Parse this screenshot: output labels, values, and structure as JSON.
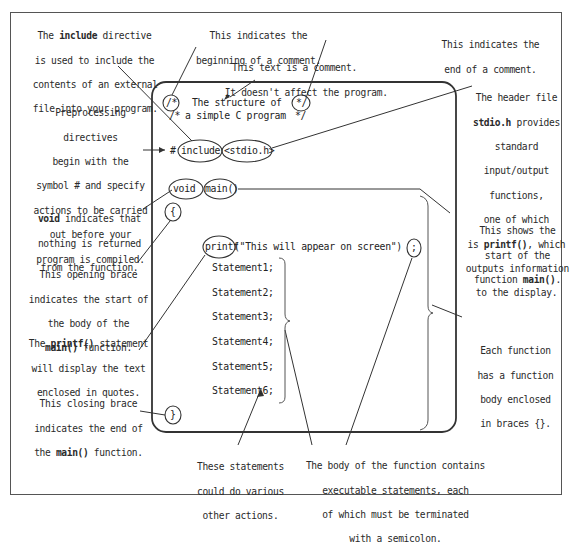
{
  "diagram": {
    "code": {
      "comment_open": "/*",
      "comment_line1": "The structure of",
      "comment_line2_prefix": "/*",
      "comment_line2": "a simple C program",
      "comment_close": "*/",
      "comment_close2": "*/",
      "hash": "#",
      "include": "include",
      "header": "<stdio.h>",
      "void": "void",
      "main": "main()",
      "open_brace": "{",
      "printf": "printf",
      "printf_args": "(\"This will appear on screen\")",
      "semicolon": ";",
      "statements": [
        "Statement1;",
        "Statement2;",
        "Statement3;",
        "Statement4;",
        "Statement5;",
        "Statement6;"
      ],
      "close_brace": "}"
    },
    "annotations": {
      "include_directive": [
        "The ",
        "include",
        " directive",
        "is used to include the",
        "contents of an external",
        "file into your program."
      ],
      "comment_begin": [
        "This indicates the",
        "beginning of a comment."
      ],
      "comment_text": [
        "This text is a comment.",
        "It doesn't affect the program."
      ],
      "comment_end": [
        "This indicates the",
        "end of a comment."
      ],
      "preprocessing": [
        "Preprocessing",
        "directives",
        "begin with the",
        "symbol # and specify",
        "actions to be carried",
        "out before your",
        "program is compiled."
      ],
      "header_file": [
        "The header file",
        "stdio.h",
        " provides",
        "standard",
        "input/output",
        "functions,",
        "one of which",
        "is ",
        "printf()",
        ", which",
        "outputs information",
        "to the display."
      ],
      "void_note": [
        "void",
        " indicates that",
        "nothing is returned",
        "from the function."
      ],
      "main_start": [
        "This shows the",
        "start of the",
        "function ",
        "main()",
        "."
      ],
      "opening_brace": [
        "This opening brace",
        "indicates the start of",
        "the body of the",
        "main()",
        " function."
      ],
      "printf_note": [
        "The ",
        "printf()",
        " statement",
        "will display the text",
        "enclosed in quotes."
      ],
      "function_body": [
        "Each function",
        "has a function",
        "body enclosed",
        "in braces {}."
      ],
      "closing_brace": [
        "This closing brace",
        "indicates the end of",
        "the ",
        "main()",
        " function."
      ],
      "other_statements": [
        "These statements",
        "could do various",
        "other actions."
      ],
      "semicolon_note": [
        "The body of the function contains",
        "executable statements, each",
        "of which must be terminated",
        "with a semicolon."
      ]
    }
  }
}
